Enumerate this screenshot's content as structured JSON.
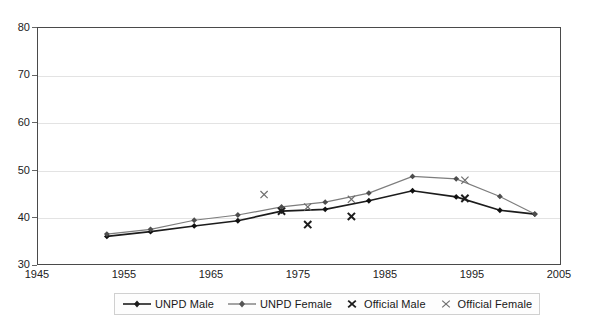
{
  "chart_data": {
    "type": "line",
    "title": "",
    "subtitle": "",
    "xlabel": "",
    "ylabel": "",
    "xlim": [
      1945,
      2005
    ],
    "ylim": [
      30,
      80
    ],
    "grid": true,
    "legend_position": "bottom",
    "y_ticks": [
      80,
      70,
      60,
      50,
      40,
      30
    ],
    "x_ticks": [
      1945,
      1955,
      1965,
      1975,
      1985,
      1995,
      2005
    ],
    "series": [
      {
        "name": "UNPD Male",
        "marker": "diamond",
        "color": "#1c1c1c",
        "line_style": "solid",
        "points": [
          {
            "x": 1953,
            "y": 36.0
          },
          {
            "x": 1958,
            "y": 37.0
          },
          {
            "x": 1963,
            "y": 38.2
          },
          {
            "x": 1968,
            "y": 39.3
          },
          {
            "x": 1973,
            "y": 41.3
          },
          {
            "x": 1978,
            "y": 41.7
          },
          {
            "x": 1983,
            "y": 43.5
          },
          {
            "x": 1988,
            "y": 45.6
          },
          {
            "x": 1993,
            "y": 44.3
          },
          {
            "x": 1998,
            "y": 41.5
          },
          {
            "x": 2002,
            "y": 40.7
          }
        ]
      },
      {
        "name": "UNPD Female",
        "marker": "diamond",
        "color": "#7d7d7d",
        "line_style": "solid",
        "points": [
          {
            "x": 1953,
            "y": 36.5
          },
          {
            "x": 1958,
            "y": 37.5
          },
          {
            "x": 1963,
            "y": 39.4
          },
          {
            "x": 1968,
            "y": 40.5
          },
          {
            "x": 1973,
            "y": 42.2
          },
          {
            "x": 1978,
            "y": 43.2
          },
          {
            "x": 1983,
            "y": 45.1
          },
          {
            "x": 1988,
            "y": 48.6
          },
          {
            "x": 1993,
            "y": 48.1
          },
          {
            "x": 1998,
            "y": 44.4
          },
          {
            "x": 2002,
            "y": 40.7
          }
        ]
      },
      {
        "name": "Official Male",
        "marker": "x-bold",
        "color": "#1c1c1c",
        "line_style": "none",
        "points": [
          {
            "x": 1973,
            "y": 41.3
          },
          {
            "x": 1976,
            "y": 38.5
          },
          {
            "x": 1981,
            "y": 40.2
          },
          {
            "x": 1994,
            "y": 44.0
          }
        ]
      },
      {
        "name": "Official Female",
        "marker": "x-thin",
        "color": "#6e6e6e",
        "line_style": "none",
        "points": [
          {
            "x": 1971,
            "y": 44.8
          },
          {
            "x": 1976,
            "y": 42.2
          },
          {
            "x": 1981,
            "y": 43.8
          },
          {
            "x": 1994,
            "y": 47.8
          }
        ]
      }
    ]
  },
  "legend": {
    "entries": [
      {
        "label": "UNPD Male",
        "icon": "line-diamond-dark"
      },
      {
        "label": "UNPD Female",
        "icon": "line-diamond-gray"
      },
      {
        "label": "Official Male",
        "icon": "x-bold"
      },
      {
        "label": "Official Female",
        "icon": "x-thin"
      }
    ]
  }
}
